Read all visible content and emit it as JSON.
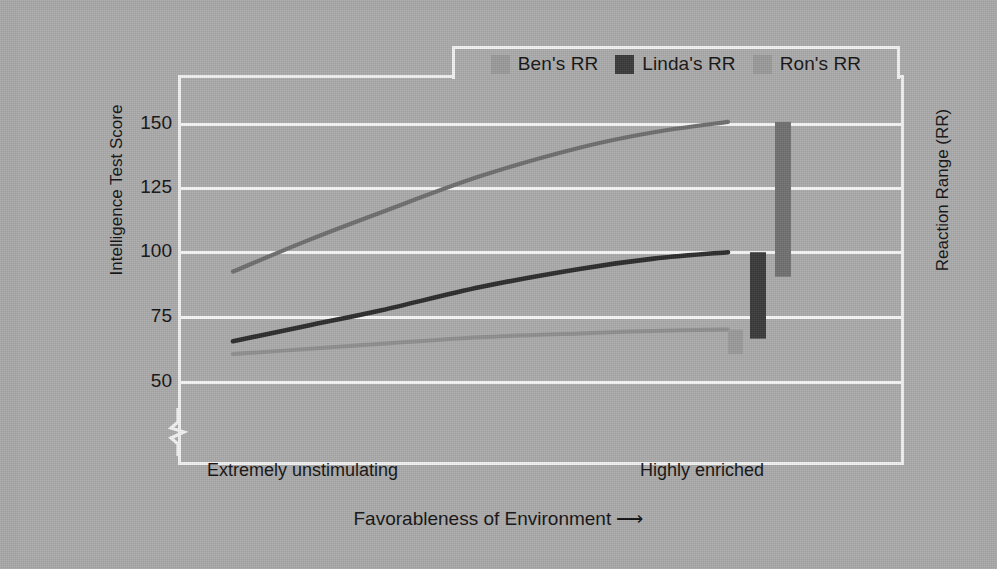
{
  "chart_data": {
    "type": "line",
    "title": "",
    "xlabel": "Favorableness of Environment ⟶",
    "ylabel": "Intelligence Test Score",
    "y2label": "Reaction Range (RR)",
    "ylim": [
      50,
      155
    ],
    "yticks": [
      50,
      75,
      100,
      125,
      150
    ],
    "ytick_labels": [
      "50",
      "75",
      "100",
      "125",
      "150"
    ],
    "axis_break": true,
    "grid": true,
    "legend_position": "top-center",
    "x_axis_type": "categorical-continuum",
    "xtick_labels": [
      "Extremely unstimulating",
      "Highly enriched"
    ],
    "series": [
      {
        "name": "Ben's RR",
        "color": "#8f8f8f",
        "x": [
          0,
          0.15,
          0.3,
          0.5,
          0.7,
          0.85,
          1
        ],
        "values": [
          61,
          63,
          65,
          67.5,
          69,
          70,
          70.5
        ],
        "rr_bar": {
          "low": 61,
          "high": 70.5,
          "color": "#9a9a9a"
        }
      },
      {
        "name": "Linda's RR",
        "color": "#2b2b2b",
        "x": [
          0,
          0.15,
          0.3,
          0.5,
          0.7,
          0.85,
          1
        ],
        "values": [
          66,
          72,
          78,
          87,
          94,
          98,
          100.5
        ],
        "rr_bar": {
          "low": 67,
          "high": 100.5,
          "color": "#3a3a3a"
        }
      },
      {
        "name": "Ron's RR",
        "color": "#6e6e6e",
        "x": [
          0,
          0.15,
          0.3,
          0.5,
          0.7,
          0.85,
          1
        ],
        "values": [
          93,
          105,
          116,
          130,
          141,
          147,
          151
        ],
        "rr_bar": {
          "low": 91,
          "high": 151,
          "color": "#717171"
        }
      }
    ]
  },
  "legend": {
    "items": [
      {
        "label": "Ben's RR",
        "color": "#9a9a9a",
        "name": "legend-ben"
      },
      {
        "label": "Linda's RR",
        "color": "#3a3a3a",
        "name": "legend-linda"
      },
      {
        "label": "Ron's RR",
        "color": "#9a9a9a",
        "name": "legend-ron"
      }
    ]
  },
  "axes": {
    "y_title": "Intelligence Test Score",
    "y2_title": "Reaction Range (RR)",
    "x_title": "Favorableness of Environment ⟶",
    "y_ticks": {
      "t150": "150",
      "t125": "125",
      "t100": "100",
      "t75": "75",
      "t50": "50"
    },
    "x_left_label": "Extremely unstimulating",
    "x_right_label": "Highly enriched"
  },
  "colors": {
    "background": "#a9a9a9",
    "panel": "#ababab",
    "frame": "#f2f2f2",
    "grid": "#f7f7f7",
    "text": "#121212",
    "ben": "#8f8f8f",
    "linda": "#2b2b2b",
    "ron": "#6e6e6e"
  }
}
